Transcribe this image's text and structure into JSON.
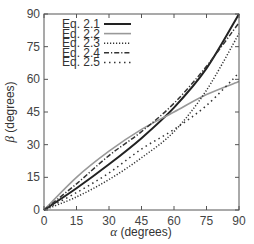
{
  "chart_data": {
    "type": "line",
    "title": "",
    "xlabel": "α (degrees)",
    "ylabel": "β (degrees)",
    "xlim": [
      0,
      90
    ],
    "ylim": [
      0,
      90
    ],
    "xticks": [
      0,
      15,
      30,
      45,
      60,
      75,
      90
    ],
    "yticks": [
      0,
      15,
      30,
      45,
      60,
      75,
      90
    ],
    "grid": false,
    "legend_position": "upper left",
    "x": [
      0,
      15,
      30,
      45,
      60,
      75,
      90
    ],
    "series": [
      {
        "name": "Eq. 2.1",
        "style": "solid",
        "color": "#222222",
        "width": 2.0,
        "values": [
          0,
          10,
          21,
          33,
          47,
          65,
          90
        ]
      },
      {
        "name": "Eq. 2.2",
        "style": "solid",
        "color": "#999999",
        "width": 1.6,
        "values": [
          0,
          15,
          27,
          37,
          45,
          53,
          59
        ]
      },
      {
        "name": "Eq. 2.3",
        "style": "dotted",
        "color": "#333333",
        "width": 1.5,
        "values": [
          0,
          6,
          14,
          24,
          36,
          55,
          81
        ]
      },
      {
        "name": "Eq. 2.4",
        "style": "dashdot",
        "color": "#333333",
        "width": 1.5,
        "values": [
          0,
          12,
          25,
          36,
          49,
          66,
          86
        ]
      },
      {
        "name": "Eq. 2.5",
        "style": "sparse-dotted",
        "color": "#333333",
        "width": 1.5,
        "values": [
          0,
          8,
          17,
          28,
          37,
          48,
          63
        ]
      }
    ]
  },
  "legend": {
    "items": [
      "Eq. 2.1",
      "Eq. 2.2",
      "Eq. 2.3",
      "Eq. 2.4",
      "Eq. 2.5"
    ]
  },
  "axes": {
    "x_title_symbol": "α",
    "x_title_unit": " (degrees)",
    "y_title_symbol": "β",
    "y_title_unit": " (degrees)"
  }
}
